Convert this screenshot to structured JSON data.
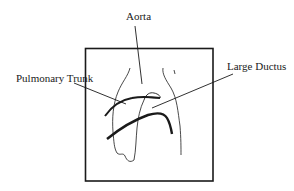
{
  "diagram": {
    "type": "anatomical-line-drawing",
    "frame": {
      "x": 85,
      "y": 48,
      "width": 128,
      "height": 133
    },
    "labels": {
      "aorta": "Aorta",
      "pulmonary_trunk": "Pulmonary Trunk",
      "large_ductus": "Large Ductus"
    },
    "colors": {
      "stroke": "#1a1a1a",
      "background": "#ffffff"
    }
  }
}
